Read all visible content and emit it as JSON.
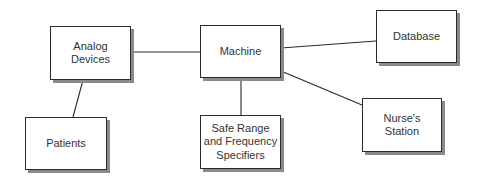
{
  "diagram": {
    "type": "block-diagram",
    "nodes": [
      {
        "id": "analog",
        "label": "Analog\nDevices"
      },
      {
        "id": "machine",
        "label": "Machine"
      },
      {
        "id": "database",
        "label": "Database"
      },
      {
        "id": "patients",
        "label": "Patients"
      },
      {
        "id": "safe",
        "label": "Safe Range\nand Frequency\nSpecifiers"
      },
      {
        "id": "nurse",
        "label": "Nurse's\nStation"
      }
    ],
    "edges": [
      {
        "from": "analog",
        "to": "machine"
      },
      {
        "from": "machine",
        "to": "database"
      },
      {
        "from": "machine",
        "to": "nurse"
      },
      {
        "from": "machine",
        "to": "safe"
      },
      {
        "from": "analog",
        "to": "patients"
      }
    ],
    "colors": {
      "stroke": "#2a2a2a",
      "shadow": "#8a8a8a",
      "text": "#333333",
      "background": "#ffffff"
    }
  }
}
